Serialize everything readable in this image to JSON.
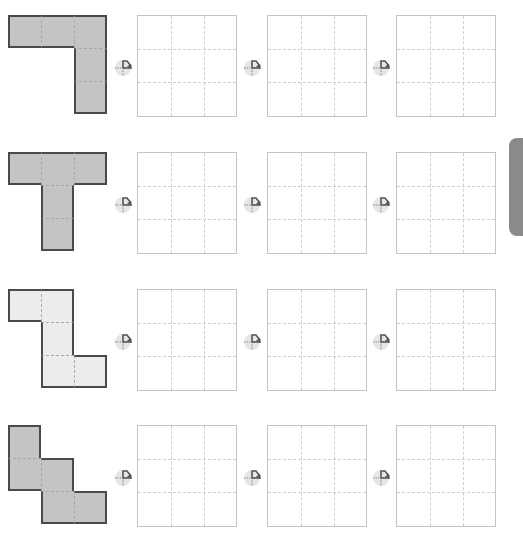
{
  "worksheet": {
    "colors": {
      "shape_dark_fill": "#c4c4c4",
      "shape_light_fill": "#ececec",
      "shape_border": "#4a4a4a",
      "grid_border": "#c4c4c4",
      "rotate_icon_bg": "#e6e6e6",
      "rotate_icon_arrow": "#555555",
      "side_tab": "#8a8a8a"
    },
    "rows": [
      {
        "shape": "L-shape",
        "fill": "dark",
        "cells": [
          [
            0,
            0
          ],
          [
            1,
            0
          ],
          [
            2,
            0
          ],
          [
            2,
            1
          ],
          [
            2,
            2
          ]
        ],
        "empty_grids": 3,
        "rotate_icons": 3
      },
      {
        "shape": "T-shape",
        "fill": "dark",
        "cells": [
          [
            0,
            0
          ],
          [
            1,
            0
          ],
          [
            2,
            0
          ],
          [
            1,
            1
          ],
          [
            1,
            2
          ]
        ],
        "empty_grids": 3,
        "rotate_icons": 3
      },
      {
        "shape": "Z-shape",
        "fill": "light",
        "cells": [
          [
            0,
            0
          ],
          [
            1,
            0
          ],
          [
            1,
            1
          ],
          [
            1,
            2
          ],
          [
            2,
            2
          ]
        ],
        "empty_grids": 3,
        "rotate_icons": 3
      },
      {
        "shape": "W-shape",
        "fill": "dark",
        "cells": [
          [
            0,
            0
          ],
          [
            0,
            1
          ],
          [
            1,
            1
          ],
          [
            1,
            2
          ],
          [
            2,
            2
          ]
        ],
        "empty_grids": 3,
        "rotate_icons": 3
      }
    ],
    "icons": {
      "rotate": "rotate-quarter-turn-clockwise-icon"
    }
  }
}
